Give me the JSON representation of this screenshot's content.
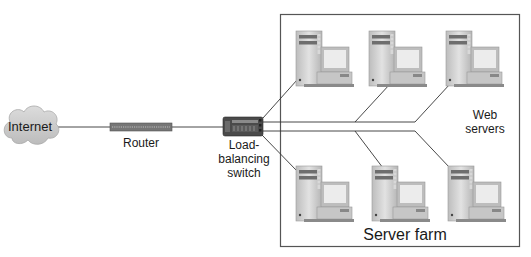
{
  "diagram": {
    "nodes": {
      "internet": {
        "label": "Internet",
        "icon": "cloud-icon"
      },
      "router": {
        "label": "Router",
        "icon": "router-icon"
      },
      "switch": {
        "label_line1": "Load-",
        "label_line2": "balancing",
        "label_line3": "switch",
        "icon": "switch-icon"
      },
      "web_servers": {
        "label_line1": "Web",
        "label_line2": "servers"
      },
      "server_farm": {
        "label": "Server farm"
      }
    },
    "servers": [
      {
        "row": "top",
        "position": 1,
        "icon": "server-computer-icon"
      },
      {
        "row": "top",
        "position": 2,
        "icon": "server-computer-icon"
      },
      {
        "row": "top",
        "position": 3,
        "icon": "server-computer-icon"
      },
      {
        "row": "bottom",
        "position": 1,
        "icon": "server-computer-icon"
      },
      {
        "row": "bottom",
        "position": 2,
        "icon": "server-computer-icon"
      },
      {
        "row": "bottom",
        "position": 3,
        "icon": "server-computer-icon"
      }
    ],
    "edges": [
      [
        "Internet",
        "Router"
      ],
      [
        "Router",
        "Load-balancing switch"
      ],
      [
        "Load-balancing switch",
        "Server top 1"
      ],
      [
        "Load-balancing switch",
        "Server top 2"
      ],
      [
        "Load-balancing switch",
        "Server top 3"
      ],
      [
        "Load-balancing switch",
        "Server bottom 1"
      ],
      [
        "Load-balancing switch",
        "Server bottom 2"
      ],
      [
        "Load-balancing switch",
        "Server bottom 3"
      ]
    ],
    "colors": {
      "cloud_fill": "#d0d0d0",
      "router_fill": "#7a7a7a",
      "switch_fill": "#4a4a4a",
      "line": "#333333",
      "frame": "#555555",
      "server_case": "#cfcfcf",
      "screen": "#e8e8e8"
    }
  }
}
